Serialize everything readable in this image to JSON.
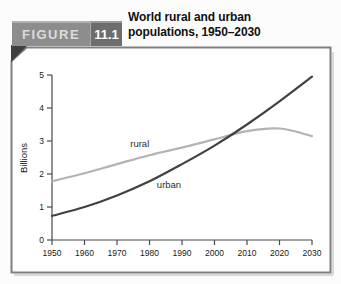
{
  "figure": {
    "label": "FIGURE",
    "number": "11.1",
    "title_line1": "World rural and urban",
    "title_line2": "populations, 1950–2030"
  },
  "chart_data": {
    "type": "line",
    "title": "World rural and urban populations, 1950–2030",
    "xlabel": "",
    "ylabel": "Billions",
    "xlim": [
      1950,
      2030
    ],
    "ylim": [
      0,
      5
    ],
    "x_ticks": [
      1950,
      1960,
      1970,
      1980,
      1990,
      2000,
      2010,
      2020,
      2030
    ],
    "y_ticks": [
      0,
      1,
      2,
      3,
      4,
      5
    ],
    "grid": false,
    "legend": "inline-labels",
    "x": [
      1950,
      1960,
      1970,
      1980,
      1990,
      2000,
      2010,
      2020,
      2030
    ],
    "series": [
      {
        "name": "rural",
        "color": "#b3b3b3",
        "values": [
          1.78,
          2.02,
          2.3,
          2.57,
          2.8,
          3.05,
          3.3,
          3.38,
          3.15
        ],
        "label_pos": {
          "x": 1977,
          "y": 2.92
        }
      },
      {
        "name": "urban",
        "color": "#414141",
        "values": [
          0.73,
          1.0,
          1.35,
          1.78,
          2.3,
          2.86,
          3.5,
          4.2,
          4.95
        ],
        "label_pos": {
          "x": 1986,
          "y": 1.68
        }
      }
    ]
  },
  "colors": {
    "tab_figure_bg": "#8d8d8d",
    "tab_number_bg": "#6d6d6d",
    "panel_border": "#7f7f7f",
    "axis": "#4a4a4a",
    "tick_label": "#1a1a1a",
    "series_label": "#2e2e2e"
  }
}
